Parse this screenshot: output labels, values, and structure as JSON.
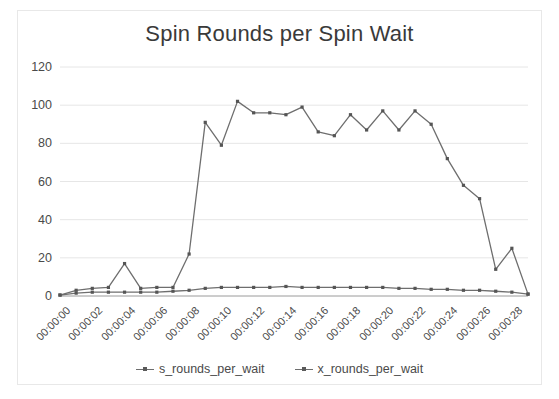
{
  "chart_data": {
    "type": "line",
    "title": "Spin Rounds per Spin Wait",
    "xlabel": "",
    "ylabel": "",
    "ylim": [
      0,
      120
    ],
    "yticks": [
      0,
      20,
      40,
      60,
      80,
      100,
      120
    ],
    "grid": true,
    "legend_position": "bottom",
    "x": [
      "00:00:00",
      "00:00:01",
      "00:00:02",
      "00:00:03",
      "00:00:04",
      "00:00:05",
      "00:00:06",
      "00:00:07",
      "00:00:08",
      "00:00:09",
      "00:00:10",
      "00:00:11",
      "00:00:12",
      "00:00:13",
      "00:00:14",
      "00:00:15",
      "00:00:16",
      "00:00:17",
      "00:00:18",
      "00:00:19",
      "00:00:20",
      "00:00:21",
      "00:00:22",
      "00:00:23",
      "00:00:24",
      "00:00:25",
      "00:00:26",
      "00:00:27",
      "00:00:28",
      "00:00:29"
    ],
    "xtick_labels": [
      "00:00:00",
      "00:00:02",
      "00:00:04",
      "00:00:06",
      "00:00:08",
      "00:00:10",
      "00:00:12",
      "00:00:14",
      "00:00:16",
      "00:00:18",
      "00:00:20",
      "00:00:22",
      "00:00:24",
      "00:00:26",
      "00:00:28"
    ],
    "series": [
      {
        "name": "s_rounds_per_wait",
        "color": "#6e6e6e",
        "values": [
          0.5,
          1.5,
          2,
          2,
          2,
          2,
          2,
          2.5,
          3,
          4,
          4.5,
          4.5,
          4.5,
          4.5,
          5,
          4.5,
          4.5,
          4.5,
          4.5,
          4.5,
          4.5,
          4,
          4,
          3.5,
          3.5,
          3,
          3,
          2.5,
          2,
          1
        ]
      },
      {
        "name": "x_rounds_per_wait",
        "color": "#6e6e6e",
        "values": [
          0.5,
          3,
          4,
          4.5,
          17,
          4,
          4.5,
          4.5,
          22,
          91,
          79,
          102,
          96,
          96,
          95,
          99,
          86,
          84,
          95,
          87,
          97,
          87,
          97,
          90,
          72,
          58,
          51,
          14,
          25,
          1
        ]
      }
    ]
  },
  "legend": {
    "items": [
      {
        "label": "s_rounds_per_wait"
      },
      {
        "label": "x_rounds_per_wait"
      }
    ]
  }
}
